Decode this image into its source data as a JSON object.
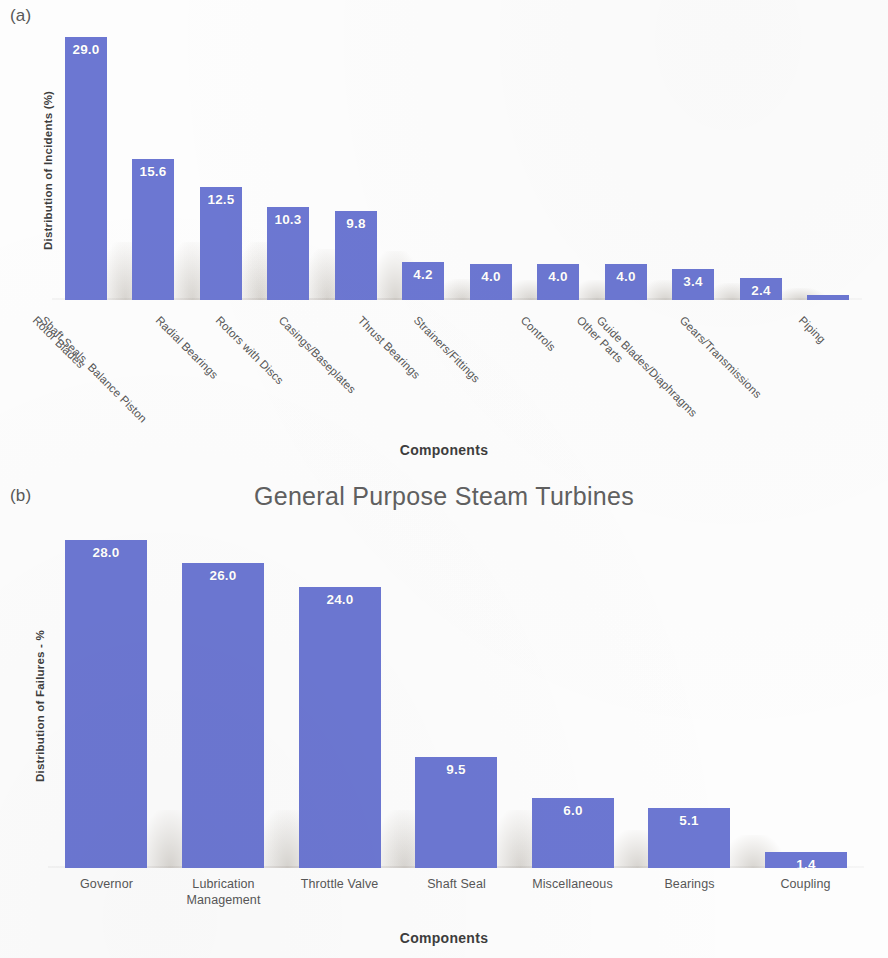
{
  "panels": {
    "a": {
      "tag": "(a)",
      "title": ""
    },
    "b": {
      "tag": "(b)",
      "title": "General Purpose Steam Turbines"
    }
  },
  "colors": {
    "bar": "#6c77d2",
    "value_label": "#ffffff",
    "axis_text": "#575757",
    "title": "#606060"
  },
  "chart_data": [
    {
      "type": "bar",
      "panel": "(a)",
      "title": "",
      "xlabel": "Components",
      "ylabel": "Distribution of Incidents (%)",
      "ylim": [
        0,
        30
      ],
      "grid": false,
      "legend": "none",
      "categories": [
        "Rotor Blades",
        "Shaft Seals, Balance Piston",
        "Radial Bearings",
        "Rotors with Discs",
        "Casings/Baseplates",
        "Thrust Bearings",
        "Strainers/Fittings",
        "Controls",
        "Other Parts",
        "Guide Blades/Diaphragms",
        "Gears/Transmissions",
        "Piping"
      ],
      "values": [
        29.0,
        15.6,
        12.5,
        10.3,
        9.8,
        4.2,
        4.0,
        4.0,
        4.0,
        3.4,
        2.4,
        0.6
      ],
      "value_labels": [
        "29.0",
        "15.6",
        "12.5",
        "10.3",
        "9.8",
        "4.2",
        "4.0",
        "4.0",
        "4.0",
        "3.4",
        "2.4",
        ""
      ]
    },
    {
      "type": "bar",
      "panel": "(b)",
      "title": "General Purpose Steam Turbines",
      "xlabel": "Components",
      "ylabel": "Distribution of Failures - %",
      "ylim": [
        0,
        29
      ],
      "grid": false,
      "legend": "none",
      "categories": [
        "Governor",
        "Lubrication Management",
        "Throttle Valve",
        "Shaft Seal",
        "Miscellaneous",
        "Bearings",
        "Coupling"
      ],
      "values": [
        28.0,
        26.0,
        24.0,
        9.5,
        6.0,
        5.1,
        1.4
      ],
      "value_labels": [
        "28.0",
        "26.0",
        "24.0",
        "9.5",
        "6.0",
        "5.1",
        "1.4"
      ]
    }
  ]
}
